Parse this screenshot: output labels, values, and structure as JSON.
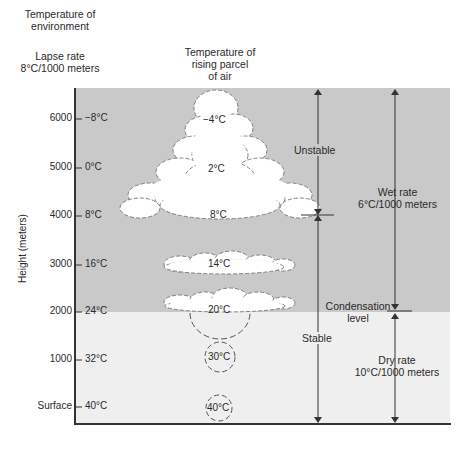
{
  "headers": {
    "environment_line1": "Temperature of",
    "environment_line2": "environment",
    "lapse_line1": "Lapse rate",
    "lapse_line2": "8°C/1000 meters",
    "parcel_line1": "Temperature of",
    "parcel_line2": "rising parcel",
    "parcel_line3": "of air"
  },
  "y_axis": {
    "label": "Height (meters)",
    "ticks": [
      {
        "height": "6000",
        "env_temp": "−8°C"
      },
      {
        "height": "5000",
        "env_temp": "0°C"
      },
      {
        "height": "4000",
        "env_temp": "8°C"
      },
      {
        "height": "3000",
        "env_temp": "16°C"
      },
      {
        "height": "2000",
        "env_temp": "24°C"
      },
      {
        "height": "1000",
        "env_temp": "32°C"
      },
      {
        "height": "Surface",
        "env_temp": "40°C"
      }
    ]
  },
  "parcel_temps": [
    "−4°C",
    "2°C",
    "8°C",
    "14°C",
    "20°C",
    "30°C",
    "40°C"
  ],
  "annotations": {
    "unstable": "Unstable",
    "stable": "Stable",
    "wet_rate_line1": "Wet rate",
    "wet_rate_line2": "6°C/1000 meters",
    "condensation_line1": "Condensation",
    "condensation_line2": "level",
    "dry_rate_line1": "Dry rate",
    "dry_rate_line2": "10°C/1000 meters"
  },
  "colors": {
    "upper_zone": "#c9c9c9",
    "lower_zone": "#efefef",
    "axis": "#333333",
    "cloud": "#ffffff"
  }
}
